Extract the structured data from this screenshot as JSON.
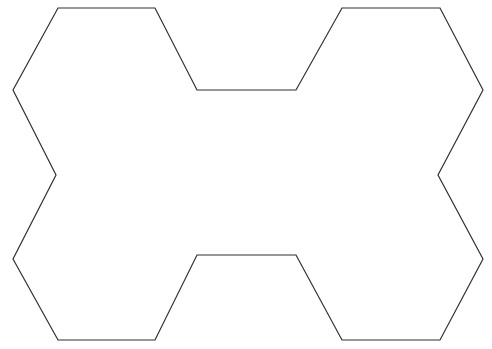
{
  "figure": {
    "title": "Polyhex Outline",
    "canvas": {
      "width": 492,
      "height": 349,
      "background_color": "#ffffff"
    },
    "shape": {
      "name": "polyhex-outline",
      "kind": "closed-polygon",
      "fill_color": "#ffffff",
      "stroke_color": "#303030",
      "stroke_width": 1.2,
      "vertex_count": 20,
      "points": [
        [
          58,
          8
        ],
        [
          155,
          8
        ],
        [
          197,
          90
        ],
        [
          296,
          90
        ],
        [
          342,
          8
        ],
        [
          440,
          8
        ],
        [
          483,
          90
        ],
        [
          438,
          175
        ],
        [
          483,
          259
        ],
        [
          440,
          340
        ],
        [
          342,
          340
        ],
        [
          296,
          255
        ],
        [
          197,
          255
        ],
        [
          155,
          340
        ],
        [
          58,
          340
        ],
        [
          13,
          259
        ],
        [
          56,
          175
        ],
        [
          13,
          90
        ]
      ],
      "path_d": "M 58 8 L 155 8 L 197 90 L 296 90 L 342 8 L 440 8 L 483 90 L 438 175 L 483 259 L 440 340 L 342 340 L 296 255 L 197 255 L 155 340 L 58 340 L 13 259 L 56 175 L 13 90 Z"
    },
    "notable_vertices": {
      "leftmost": [
        13,
        90
      ],
      "rightmost": [
        483,
        90
      ],
      "top_notch_left": [
        197,
        90
      ],
      "top_notch_right": [
        296,
        90
      ],
      "bottom_notch_left": [
        197,
        255
      ],
      "bottom_notch_right": [
        296,
        255
      ],
      "left_waist": [
        56,
        175
      ],
      "right_waist": [
        438,
        175
      ]
    }
  }
}
